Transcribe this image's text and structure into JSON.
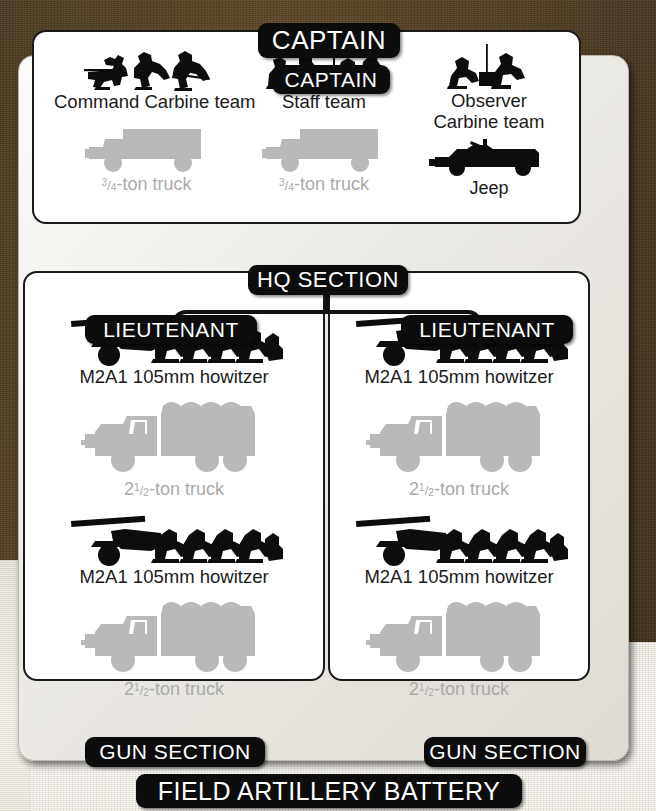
{
  "chart_title": "FIELD ARTILLERY BATTERY",
  "header": {
    "top_command_label": "CAPTAIN"
  },
  "hq_section": {
    "command_label": "CAPTAIN",
    "section_label": "HQ SECTION",
    "units": [
      {
        "personnel_label": "Command Carbine team",
        "personnel_icon": "three-crouching-soldiers-carbine-icon",
        "vehicle_label_prefix": "",
        "vehicle_fraction_numerator": "3",
        "vehicle_fraction_denominator": "4",
        "vehicle_label_suffix": "-ton truck",
        "vehicle_icon": "quarter-ton-weapons-carrier-icon",
        "vehicle_color": "#b9b9b9"
      },
      {
        "personnel_label": "Staff team",
        "personnel_icon": "staff-officers-at-table-icon",
        "vehicle_label_prefix": "",
        "vehicle_fraction_numerator": "3",
        "vehicle_fraction_denominator": "4",
        "vehicle_label_suffix": "-ton truck",
        "vehicle_icon": "quarter-ton-weapons-carrier-icon",
        "vehicle_color": "#b9b9b9"
      },
      {
        "personnel_label_line1": "Observer",
        "personnel_label_line2": "Carbine team",
        "personnel_icon": "two-kneeling-observers-radio-icon",
        "vehicle_label": "Jeep",
        "vehicle_icon": "jeep-icon",
        "vehicle_color": "#0d0d0d"
      }
    ]
  },
  "gun_sections": [
    {
      "command_label": "LIEUTENANT",
      "section_label": "GUN SECTION",
      "guns": [
        {
          "gun_label": "M2A1 105mm howitzer",
          "gun_icon": "howitzer-with-five-crew-icon",
          "vehicle_label_prefix": "2",
          "vehicle_fraction_numerator": "1",
          "vehicle_fraction_denominator": "2",
          "vehicle_label_suffix": "-ton truck",
          "vehicle_icon": "cargo-truck-6x6-icon",
          "vehicle_color": "#b9b9b9"
        },
        {
          "gun_label": "M2A1 105mm howitzer",
          "gun_icon": "howitzer-with-five-crew-icon",
          "vehicle_label_prefix": "2",
          "vehicle_fraction_numerator": "1",
          "vehicle_fraction_denominator": "2",
          "vehicle_label_suffix": "-ton truck",
          "vehicle_icon": "cargo-truck-6x6-icon",
          "vehicle_color": "#b9b9b9"
        }
      ]
    },
    {
      "command_label": "LIEUTENANT",
      "section_label": "GUN SECTION",
      "guns": [
        {
          "gun_label": "M2A1 105mm howitzer",
          "gun_icon": "howitzer-with-five-crew-icon",
          "vehicle_label_prefix": "2",
          "vehicle_fraction_numerator": "1",
          "vehicle_fraction_denominator": "2",
          "vehicle_label_suffix": "-ton truck",
          "vehicle_icon": "cargo-truck-6x6-icon",
          "vehicle_color": "#b9b9b9"
        },
        {
          "gun_label": "M2A1 105mm howitzer",
          "gun_icon": "howitzer-with-five-crew-icon",
          "vehicle_label_prefix": "2",
          "vehicle_fraction_numerator": "1",
          "vehicle_fraction_denominator": "2",
          "vehicle_label_suffix": "-ton truck",
          "vehicle_icon": "cargo-truck-6x6-icon",
          "vehicle_color": "#b9b9b9"
        }
      ]
    }
  ],
  "colors": {
    "pill_background": "#0c0c0c",
    "pill_text": "#ffffff",
    "panel_background": "#ffffff",
    "panel_border": "#1a1a1a",
    "frame_background": "#eceae5",
    "icon_black": "#0d0d0d",
    "icon_gray": "#b9b9b9",
    "backdrop_brown": "#4e3c21",
    "backdrop_cream": "#e8e3d8"
  }
}
